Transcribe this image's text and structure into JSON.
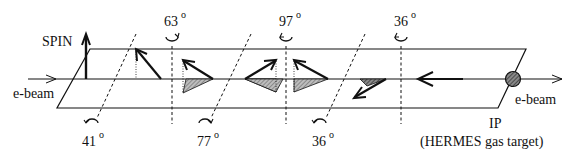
{
  "diagram": {
    "spin_label": "SPIN",
    "beam_label_left": "e-beam",
    "beam_label_right": "e-beam",
    "ip_label": "IP",
    "ip_sublabel": "(HERMES gas target)",
    "rotations_top": [
      {
        "angle": "63",
        "unit": "o"
      },
      {
        "angle": "97",
        "unit": "o"
      },
      {
        "angle": "36",
        "unit": "o"
      }
    ],
    "rotations_bottom": [
      {
        "angle": "41",
        "unit": "o"
      },
      {
        "angle": "77",
        "unit": "o"
      },
      {
        "angle": "36",
        "unit": "o"
      }
    ],
    "colors": {
      "line": "#111111",
      "hatch": "#777777",
      "background": "#ffffff"
    }
  }
}
